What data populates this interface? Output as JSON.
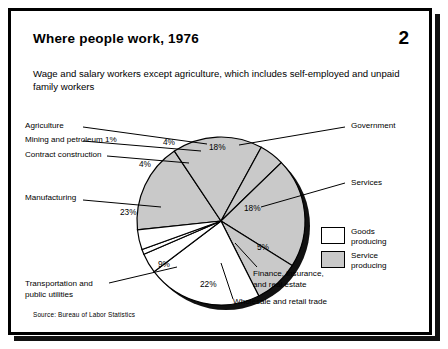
{
  "card": {
    "title": "Where people work, 1976",
    "page_number": "2",
    "subtitle": "Wage and salary workers except agriculture, which includes self-employed and unpaid family workers",
    "source": "Source: Bureau of Labor Statistics"
  },
  "legend": {
    "items": [
      {
        "label": "Goods\nproducing",
        "color": "#ffffff",
        "name": "goods-producing"
      },
      {
        "label": "Service\nproducing",
        "color": "#c9c9c9",
        "name": "service-producing"
      }
    ]
  },
  "colors": {
    "goods": "#ffffff",
    "service": "#c9c9c9",
    "outline": "#000000",
    "shadow": "#111111"
  },
  "chart_data": {
    "type": "pie",
    "title": "Where people work, 1976",
    "subtitle": "Wage and salary workers except agriculture, which includes self-employed and unpaid family workers",
    "unit": "percent",
    "legend_position": "right",
    "categories": [
      "Government",
      "Services",
      "Finance, insurance, and real estate",
      "Wholesale and retail trade",
      "Transportation and public utilities",
      "Manufacturing",
      "Contract construction",
      "Mining and petroleum",
      "Agriculture"
    ],
    "values": [
      18,
      18,
      5,
      22,
      9,
      23,
      4,
      1,
      4
    ],
    "slices": [
      {
        "label": "Government",
        "value": 18,
        "display": "18%",
        "group": "Service producing",
        "color": "#c9c9c9"
      },
      {
        "label": "Services",
        "value": 18,
        "display": "18%",
        "group": "Service producing",
        "color": "#c9c9c9"
      },
      {
        "label": "Finance, insurance, and real estate",
        "value": 5,
        "display": "5%",
        "group": "Service producing",
        "color": "#c9c9c9"
      },
      {
        "label": "Wholesale and retail trade",
        "value": 22,
        "display": "22%",
        "group": "Service producing",
        "color": "#c9c9c9"
      },
      {
        "label": "Transportation and public utilities",
        "value": 9,
        "display": "9%",
        "group": "Service producing",
        "color": "#c9c9c9"
      },
      {
        "label": "Manufacturing",
        "value": 23,
        "display": "23%",
        "group": "Goods producing",
        "color": "#ffffff"
      },
      {
        "label": "Contract construction",
        "value": 4,
        "display": "4%",
        "group": "Goods producing",
        "color": "#ffffff"
      },
      {
        "label": "Mining and petroleum",
        "value": 1,
        "display": "1%",
        "group": "Goods producing",
        "color": "#ffffff"
      },
      {
        "label": "Agriculture",
        "value": 4,
        "display": "4%",
        "group": "Goods producing",
        "color": "#ffffff"
      }
    ]
  },
  "callouts": {
    "agriculture": "Agriculture",
    "mining": "Mining and petroleum 1%",
    "construction": "Contract construction",
    "manufacturing": "Manufacturing",
    "transportation": "Transportation and\npublic utilities",
    "government": "Government",
    "services": "Services",
    "finance": "Finance, insurance,\nand real estate",
    "wholesale": "Wholesale and retail trade"
  },
  "slice_labels": {
    "agriculture": "4%",
    "construction": "4%",
    "manufacturing": "23%",
    "transportation": "9%",
    "wholesale": "22%",
    "finance": "5%",
    "services": "18%",
    "government": "18%"
  }
}
